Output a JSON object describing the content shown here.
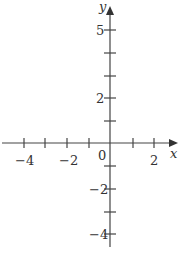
{
  "diagram": {
    "type": "coordinate-axes",
    "x_axis": {
      "label": "x",
      "ticks": [
        -4,
        -3,
        -2,
        -1,
        1,
        2
      ],
      "labeled_ticks": [
        {
          "value": -4,
          "text": "−4"
        },
        {
          "value": -2,
          "text": "−2"
        },
        {
          "value": 2,
          "text": "2"
        }
      ]
    },
    "y_axis": {
      "label": "y",
      "ticks": [
        -4,
        -3,
        -2,
        -1,
        1,
        2,
        3,
        4,
        5
      ],
      "labeled_ticks": [
        {
          "value": 5,
          "text": "5"
        },
        {
          "value": 2,
          "text": "2"
        },
        {
          "value": -2,
          "text": "−2"
        },
        {
          "value": -4,
          "text": "−4"
        }
      ]
    },
    "origin_label": "0",
    "colors": {
      "axis": "#444444",
      "text": "#333333"
    }
  }
}
